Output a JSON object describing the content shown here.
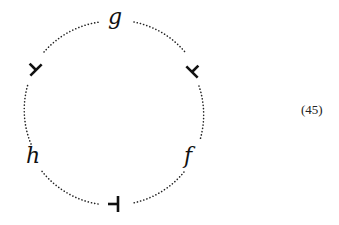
{
  "diagram": {
    "type": "circular string diagram",
    "circle": {
      "cx": 114,
      "cy": 112,
      "r": 90,
      "stroke": "#222222",
      "style": "dotted"
    },
    "labels": [
      {
        "id": "g",
        "text": "g",
        "position": "top"
      },
      {
        "id": "h",
        "text": "h",
        "position": "lower-left"
      },
      {
        "id": "f",
        "text": "f",
        "position": "lower-right"
      }
    ],
    "tacks": [
      {
        "id": "tack-upper-left",
        "position": "upper-left",
        "glyph": "up-tack rotated"
      },
      {
        "id": "tack-upper-right",
        "position": "upper-right",
        "glyph": "up-tack rotated"
      },
      {
        "id": "tack-bottom",
        "position": "bottom",
        "glyph": "left-tack"
      }
    ],
    "equation_number": "(45)"
  }
}
